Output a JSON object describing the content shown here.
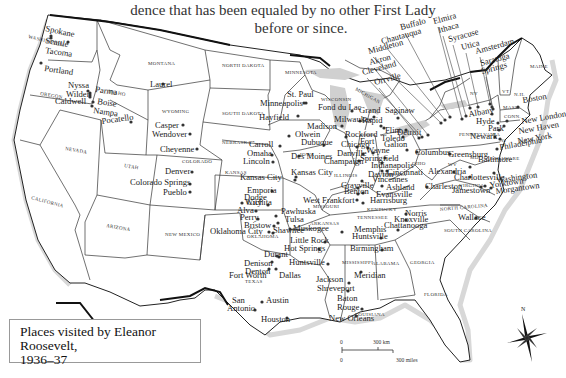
{
  "caption": {
    "line1": "dence that has been equaled by no other First Lady",
    "line2": "before or since."
  },
  "legend": {
    "title_line1": "Places visited by Eleanor Roosevelt,",
    "title_line2": "1936–37"
  },
  "scale_bar": {
    "km_zero": "0",
    "km_label": "300 km",
    "mi_zero": "0",
    "mi_label": "300 miles"
  },
  "compass": {
    "north_label": "N"
  },
  "states": [
    {
      "name": "WASHINGTON",
      "x": 28,
      "y": 38,
      "r": 14
    },
    {
      "name": "OREGON",
      "x": 40,
      "y": 95,
      "r": 10
    },
    {
      "name": "IDAHO",
      "x": 108,
      "y": 93,
      "r": 10
    },
    {
      "name": "MONTANA",
      "x": 148,
      "y": 65,
      "r": 0
    },
    {
      "name": "NORTH DAKOTA",
      "x": 222,
      "y": 67,
      "r": 0
    },
    {
      "name": "MINNESOTA",
      "x": 285,
      "y": 74,
      "r": 0
    },
    {
      "name": "SOUTH DAKOTA",
      "x": 222,
      "y": 115,
      "r": 0
    },
    {
      "name": "WYOMING",
      "x": 162,
      "y": 113,
      "r": 0
    },
    {
      "name": "NEBRASKA",
      "x": 222,
      "y": 144,
      "r": 0
    },
    {
      "name": "IOWA",
      "x": 300,
      "y": 156,
      "r": 0
    },
    {
      "name": "ILLINOIS",
      "x": 334,
      "y": 177,
      "r": 0
    },
    {
      "name": "WISCONSIN",
      "x": 321,
      "y": 101,
      "r": 0
    },
    {
      "name": "MICHIGAN",
      "x": 355,
      "y": 90,
      "r": 30
    },
    {
      "name": "NEVADA",
      "x": 65,
      "y": 150,
      "r": 10
    },
    {
      "name": "UTAH",
      "x": 124,
      "y": 167,
      "r": 10
    },
    {
      "name": "COLORADO",
      "x": 182,
      "y": 163,
      "r": 0
    },
    {
      "name": "KANSAS",
      "x": 225,
      "y": 174,
      "r": 0
    },
    {
      "name": "CALIFORNIA",
      "x": 31,
      "y": 199,
      "r": 15
    },
    {
      "name": "ARIZONA",
      "x": 106,
      "y": 227,
      "r": 10
    },
    {
      "name": "NEW MEXICO",
      "x": 165,
      "y": 236,
      "r": 0
    },
    {
      "name": "OKLAHOMA",
      "x": 247,
      "y": 238,
      "r": 0
    },
    {
      "name": "TEXAS",
      "x": 245,
      "y": 283,
      "r": 0
    },
    {
      "name": "ARKANSAS",
      "x": 310,
      "y": 225,
      "r": 0
    },
    {
      "name": "MISSOURI",
      "x": 313,
      "y": 208,
      "r": 0
    },
    {
      "name": "TENNESSEE",
      "x": 357,
      "y": 219,
      "r": 0
    },
    {
      "name": "KENTUCKY",
      "x": 367,
      "y": 211,
      "r": 0
    },
    {
      "name": "MISSISSIPPI",
      "x": 342,
      "y": 264,
      "r": 0
    },
    {
      "name": "ALABAMA",
      "x": 372,
      "y": 265,
      "r": 0
    },
    {
      "name": "GEORGIA",
      "x": 410,
      "y": 264,
      "r": 0
    },
    {
      "name": "FLORIDA",
      "x": 424,
      "y": 296,
      "r": 0
    },
    {
      "name": "LOUISIANA",
      "x": 355,
      "y": 316,
      "r": 0
    },
    {
      "name": "NORTH CAROLINA",
      "x": 440,
      "y": 211,
      "r": -5
    },
    {
      "name": "SOUTH CAROLINA",
      "x": 444,
      "y": 232,
      "r": 0
    },
    {
      "name": "VIRGINIA",
      "x": 459,
      "y": 187,
      "r": 0
    },
    {
      "name": "INDIANA",
      "x": 383,
      "y": 176,
      "r": 0
    },
    {
      "name": "OHIO",
      "x": 412,
      "y": 165,
      "r": 0
    },
    {
      "name": "PENNSYLVANIA",
      "x": 459,
      "y": 136,
      "r": 0
    },
    {
      "name": "NY",
      "x": 470,
      "y": 95,
      "r": 0
    },
    {
      "name": "NJ",
      "x": 500,
      "y": 142,
      "r": 0
    },
    {
      "name": "MD",
      "x": 470,
      "y": 159,
      "r": 0
    },
    {
      "name": "DELAWARE",
      "x": 490,
      "y": 160,
      "r": 0
    },
    {
      "name": "VT",
      "x": 502,
      "y": 93,
      "r": 0
    },
    {
      "name": "N.H.",
      "x": 514,
      "y": 96,
      "r": 0
    },
    {
      "name": "MAINE",
      "x": 530,
      "y": 68,
      "r": 0
    },
    {
      "name": "MASS.",
      "x": 503,
      "y": 109,
      "r": 0
    },
    {
      "name": "CONN.",
      "x": 504,
      "y": 118,
      "r": 0
    },
    {
      "name": "WV",
      "x": 448,
      "y": 166,
      "r": 0
    }
  ],
  "cities": [
    {
      "name": "Spokane",
      "x": 45,
      "y": 31,
      "dx": 68,
      "dy": 42,
      "r": 12
    },
    {
      "name": "Seattle",
      "x": 45,
      "y": 43,
      "dx": 51,
      "dy": 36,
      "r": 10
    },
    {
      "name": "Tacoma",
      "x": 45,
      "y": 53,
      "dx": 51,
      "dy": 38,
      "r": 8
    },
    {
      "name": "Portland",
      "x": 44,
      "y": 71,
      "dx": 41,
      "dy": 63,
      "r": 8
    },
    {
      "name": "Nyssa",
      "x": 68,
      "y": 88,
      "dx": 88,
      "dy": 91,
      "r": 0
    },
    {
      "name": "Parma",
      "x": 95,
      "y": 92,
      "dx": 90,
      "dy": 93,
      "r": 8
    },
    {
      "name": "Wilder",
      "x": 66,
      "y": 97,
      "dx": 90,
      "dy": 95,
      "r": 0
    },
    {
      "name": "Caldwell",
      "x": 55,
      "y": 104,
      "dx": 90,
      "dy": 97,
      "r": 0
    },
    {
      "name": "Boise",
      "x": 97,
      "y": 104,
      "dx": 93,
      "dy": 102,
      "r": 8
    },
    {
      "name": "Nampa",
      "x": 93,
      "y": 113,
      "dx": 92,
      "dy": 106,
      "r": 8
    },
    {
      "name": "Pocatello",
      "x": 102,
      "y": 124,
      "dx": 131,
      "dy": 122,
      "r": -8
    },
    {
      "name": "Laurel",
      "x": 150,
      "y": 87,
      "dx": 163,
      "dy": 84,
      "r": 0
    },
    {
      "name": "Casper",
      "x": 155,
      "y": 128,
      "dx": 183,
      "dy": 125,
      "r": 0
    },
    {
      "name": "Wendover",
      "x": 152,
      "y": 137,
      "dx": 190,
      "dy": 134,
      "r": 0
    },
    {
      "name": "Cheyenne",
      "x": 160,
      "y": 152,
      "dx": 197,
      "dy": 149,
      "r": 0
    },
    {
      "name": "Denver",
      "x": 165,
      "y": 174,
      "dx": 192,
      "dy": 172,
      "r": 0
    },
    {
      "name": "Colorado Springs",
      "x": 130,
      "y": 185,
      "dx": 190,
      "dy": 184,
      "r": 0
    },
    {
      "name": "Pueblo",
      "x": 163,
      "y": 195,
      "dx": 190,
      "dy": 192,
      "r": 0
    },
    {
      "name": "St. Paul",
      "x": 287,
      "y": 97,
      "dx": 306,
      "dy": 103,
      "r": 0
    },
    {
      "name": "Minneapolis",
      "x": 260,
      "y": 106,
      "dx": 304,
      "dy": 103,
      "r": 0
    },
    {
      "name": "Hayfield",
      "x": 259,
      "y": 120,
      "dx": 298,
      "dy": 116,
      "r": 0
    },
    {
      "name": "Fond du Lac",
      "x": 318,
      "y": 110,
      "dx": 352,
      "dy": 111,
      "r": 0
    },
    {
      "name": "Madison",
      "x": 307,
      "y": 129,
      "dx": 342,
      "dy": 126,
      "r": 0
    },
    {
      "name": "Milwaukee",
      "x": 334,
      "y": 122,
      "dx": 360,
      "dy": 121,
      "r": 0
    },
    {
      "name": "Grand",
      "x": 359,
      "y": 113,
      "dx": 374,
      "dy": 117,
      "r": 0
    },
    {
      "name": "Rapid",
      "x": 362,
      "y": 123,
      "dx": 381,
      "dy": 126,
      "r": 0
    },
    {
      "name": "Saginaw",
      "x": 385,
      "y": 113,
      "dx": 398,
      "dy": 118,
      "r": 0
    },
    {
      "name": "Flint",
      "x": 385,
      "y": 133,
      "dx": 384,
      "dy": 128,
      "r": 0
    },
    {
      "name": "Detroit",
      "x": 397,
      "y": 135,
      "dx": 406,
      "dy": 130,
      "r": 0
    },
    {
      "name": "Toledo",
      "x": 381,
      "y": 141,
      "dx": 403,
      "dy": 137,
      "r": 0
    },
    {
      "name": "Carroll",
      "x": 249,
      "y": 147,
      "dx": 280,
      "dy": 146,
      "r": 0
    },
    {
      "name": "Omaha",
      "x": 247,
      "y": 156,
      "dx": 272,
      "dy": 155,
      "r": 0
    },
    {
      "name": "Lincoln",
      "x": 243,
      "y": 164,
      "dx": 273,
      "dy": 162,
      "r": 0
    },
    {
      "name": "Olwein",
      "x": 295,
      "y": 137,
      "dx": 289,
      "dy": 136,
      "r": 0
    },
    {
      "name": "Dubuque",
      "x": 301,
      "y": 145,
      "dx": 324,
      "dy": 145,
      "r": 0
    },
    {
      "name": "Des Moines",
      "x": 291,
      "y": 159,
      "dx": 299,
      "dy": 156,
      "r": 0
    },
    {
      "name": "Rockford",
      "x": 345,
      "y": 137,
      "dx": 346,
      "dy": 137,
      "r": 0
    },
    {
      "name": "Chicago",
      "x": 341,
      "y": 147,
      "dx": 357,
      "dy": 147,
      "r": 0
    },
    {
      "name": "Fort",
      "x": 360,
      "y": 144,
      "dx": 368,
      "dy": 148,
      "r": 0
    },
    {
      "name": "Wayne",
      "x": 366,
      "y": 153,
      "dx": 373,
      "dy": 153,
      "r": 0
    },
    {
      "name": "Galion",
      "x": 384,
      "y": 147,
      "dx": 407,
      "dy": 150,
      "r": 0
    },
    {
      "name": "Springfield",
      "x": 360,
      "y": 161,
      "dx": 385,
      "dy": 158,
      "r": 0
    },
    {
      "name": "Danville",
      "x": 337,
      "y": 156,
      "dx": 363,
      "dy": 154,
      "r": 0
    },
    {
      "name": "Champaign",
      "x": 324,
      "y": 164,
      "dx": 359,
      "dy": 161,
      "r": 0
    },
    {
      "name": "Indianapolis",
      "x": 371,
      "y": 168,
      "dx": 382,
      "dy": 163,
      "r": 0
    },
    {
      "name": "Columbus",
      "x": 415,
      "y": 155,
      "dx": 417,
      "dy": 152,
      "r": 0
    },
    {
      "name": "Dayton",
      "x": 368,
      "y": 177,
      "dx": 382,
      "dy": 171,
      "r": 0
    },
    {
      "name": "Cincinnati",
      "x": 387,
      "y": 175,
      "dx": 387,
      "dy": 171,
      "r": 0
    },
    {
      "name": "Vincennes",
      "x": 372,
      "y": 182,
      "dx": 362,
      "dy": 181,
      "r": 0
    },
    {
      "name": "Ashland",
      "x": 386,
      "y": 190,
      "dx": 382,
      "dy": 186,
      "r": 0
    },
    {
      "name": "Evansville",
      "x": 376,
      "y": 197,
      "dx": 363,
      "dy": 193,
      "r": 0
    },
    {
      "name": "Grayville",
      "x": 341,
      "y": 188,
      "dx": 358,
      "dy": 188,
      "r": 0
    },
    {
      "name": "Benton",
      "x": 344,
      "y": 194,
      "dx": 358,
      "dy": 194,
      "r": 0
    },
    {
      "name": "West Frankfort",
      "x": 303,
      "y": 203,
      "dx": 357,
      "dy": 200,
      "r": 0
    },
    {
      "name": "Harrisburg",
      "x": 370,
      "y": 203,
      "dx": 363,
      "dy": 203,
      "r": 0
    },
    {
      "name": "Kansas City",
      "x": 291,
      "y": 175,
      "dx": 296,
      "dy": 177,
      "r": 0
    },
    {
      "name": "Kansas City",
      "x": 240,
      "y": 180,
      "dx": 295,
      "dy": 180,
      "r": 0
    },
    {
      "name": "Emporia",
      "x": 247,
      "y": 193,
      "dx": 272,
      "dy": 191,
      "r": 0
    },
    {
      "name": "Dodge",
      "x": 244,
      "y": 200,
      "dx": 0,
      "dy": 0,
      "r": 0
    },
    {
      "name": "City",
      "x": 247,
      "y": 205,
      "dx": 242,
      "dy": 203,
      "r": 0
    },
    {
      "name": "Wichita",
      "x": 245,
      "y": 205,
      "dx": 268,
      "dy": 205,
      "r": 0
    },
    {
      "name": "Alva",
      "x": 237,
      "y": 213,
      "dx": 256,
      "dy": 211,
      "r": 0
    },
    {
      "name": "Pawhuska",
      "x": 281,
      "y": 214,
      "dx": 276,
      "dy": 216,
      "r": 0
    },
    {
      "name": "Perry",
      "x": 240,
      "y": 220,
      "dx": 258,
      "dy": 219,
      "r": 0
    },
    {
      "name": "Tulsa",
      "x": 285,
      "y": 222,
      "dx": 278,
      "dy": 223,
      "r": 0
    },
    {
      "name": "Bristow",
      "x": 244,
      "y": 228,
      "dx": 274,
      "dy": 226,
      "r": 0
    },
    {
      "name": "Muskogee",
      "x": 293,
      "y": 231,
      "dx": 290,
      "dy": 229,
      "r": 0
    },
    {
      "name": "Oklahoma City",
      "x": 210,
      "y": 234,
      "dx": 269,
      "dy": 232,
      "r": 0
    },
    {
      "name": "Shawnee",
      "x": 273,
      "y": 233,
      "dx": 273,
      "dy": 233,
      "r": 0
    },
    {
      "name": "Little Rock",
      "x": 290,
      "y": 243,
      "dx": 325,
      "dy": 242,
      "r": 0
    },
    {
      "name": "Hot Springs",
      "x": 284,
      "y": 251,
      "dx": 319,
      "dy": 249,
      "r": 0
    },
    {
      "name": "Durant",
      "x": 264,
      "y": 257,
      "dx": 279,
      "dy": 257,
      "r": 0
    },
    {
      "name": "Denison",
      "x": 244,
      "y": 266,
      "dx": 277,
      "dy": 256,
      "r": 0
    },
    {
      "name": "Denton",
      "x": 245,
      "y": 274,
      "dx": 272,
      "dy": 262,
      "r": 0
    },
    {
      "name": "Fort Worth",
      "x": 229,
      "y": 278,
      "dx": 269,
      "dy": 269,
      "r": 0
    },
    {
      "name": "Dallas",
      "x": 279,
      "y": 278,
      "dx": 276,
      "dy": 269,
      "r": 0
    },
    {
      "name": "Huntsville",
      "x": 289,
      "y": 265,
      "dx": 328,
      "dy": 264,
      "r": 0
    },
    {
      "name": "Jackson",
      "x": 316,
      "y": 282,
      "dx": 349,
      "dy": 283,
      "r": 0
    },
    {
      "name": "Shreveport",
      "x": 317,
      "y": 291,
      "dx": 348,
      "dy": 291,
      "r": 0
    },
    {
      "name": "San",
      "x": 232,
      "y": 303,
      "dx": 0,
      "dy": 0,
      "r": 0
    },
    {
      "name": "Antonio",
      "x": 227,
      "y": 311,
      "dx": 255,
      "dy": 310,
      "r": 0
    },
    {
      "name": "Austin",
      "x": 266,
      "y": 303,
      "dx": 262,
      "dy": 302,
      "r": 0
    },
    {
      "name": "Houston",
      "x": 261,
      "y": 322,
      "dx": 287,
      "dy": 318,
      "r": 0
    },
    {
      "name": "Baton",
      "x": 337,
      "y": 301,
      "dx": 0,
      "dy": 0,
      "r": 0
    },
    {
      "name": "Rouge",
      "x": 337,
      "y": 310,
      "dx": 362,
      "dy": 309,
      "r": 0
    },
    {
      "name": "New Orleans",
      "x": 329,
      "y": 321,
      "dx": 356,
      "dy": 316,
      "r": 0
    },
    {
      "name": "Memphis",
      "x": 354,
      "y": 232,
      "dx": 342,
      "dy": 232,
      "r": 0
    },
    {
      "name": "Norris",
      "x": 405,
      "y": 216,
      "dx": 406,
      "dy": 214,
      "r": 0
    },
    {
      "name": "Knoxville",
      "x": 394,
      "y": 222,
      "dx": 406,
      "dy": 220,
      "r": 0
    },
    {
      "name": "Chattanooga",
      "x": 384,
      "y": 228,
      "dx": 398,
      "dy": 230,
      "r": 0
    },
    {
      "name": "Huntsville",
      "x": 352,
      "y": 239,
      "dx": 381,
      "dy": 238,
      "r": 0
    },
    {
      "name": "Birmingham",
      "x": 350,
      "y": 251,
      "dx": 382,
      "dy": 250,
      "r": 0
    },
    {
      "name": "Meridian",
      "x": 354,
      "y": 278,
      "dx": 361,
      "dy": 272,
      "r": 0
    },
    {
      "name": "Wallace",
      "x": 458,
      "y": 220,
      "dx": 476,
      "dy": 218,
      "r": 0
    },
    {
      "name": "Charleston",
      "x": 425,
      "y": 189,
      "dx": 427,
      "dy": 187,
      "r": 0
    },
    {
      "name": "Alexandria",
      "x": 428,
      "y": 174,
      "dx": 454,
      "dy": 172,
      "r": 0
    },
    {
      "name": "Greensburg",
      "x": 448,
      "y": 157,
      "dx": 450,
      "dy": 154,
      "r": 0
    },
    {
      "name": "Baltimore",
      "x": 478,
      "y": 162,
      "dx": 470,
      "dy": 167,
      "r": 0
    },
    {
      "name": "Charlottesville",
      "x": 454,
      "y": 180,
      "dx": 470,
      "dy": 177,
      "r": 0
    },
    {
      "name": "Washington",
      "x": 497,
      "y": 183,
      "dx": 494,
      "dy": 173,
      "r": -8
    },
    {
      "name": "Yorktown",
      "x": 490,
      "y": 188,
      "dx": 485,
      "dy": 186,
      "r": -8
    },
    {
      "name": "Morgantown",
      "x": 496,
      "y": 194,
      "dx": 491,
      "dy": 188,
      "r": -8
    },
    {
      "name": "Jamestown",
      "x": 452,
      "y": 193,
      "dx": 481,
      "dy": 187,
      "r": 0
    },
    {
      "name": "Philadelphia",
      "x": 500,
      "y": 150,
      "dx": 497,
      "dy": 149,
      "r": -10
    },
    {
      "name": "New York",
      "x": 518,
      "y": 144,
      "dx": 500,
      "dy": 139,
      "r": -10
    },
    {
      "name": "New Haven",
      "x": 519,
      "y": 134,
      "dx": 504,
      "dy": 126,
      "r": -10
    },
    {
      "name": "New London",
      "x": 522,
      "y": 124,
      "dx": 507,
      "dy": 121,
      "r": -10
    },
    {
      "name": "Newark",
      "x": 470,
      "y": 139,
      "dx": 495,
      "dy": 137,
      "r": 0
    },
    {
      "name": "Hyde",
      "x": 476,
      "y": 124,
      "dx": 498,
      "dy": 123,
      "r": 0
    },
    {
      "name": "Park",
      "x": 488,
      "y": 131,
      "dx": 499,
      "dy": 130,
      "r": 0
    },
    {
      "name": "Albany",
      "x": 469,
      "y": 117,
      "dx": 492,
      "dy": 114,
      "r": -10
    },
    {
      "name": "Boston",
      "x": 523,
      "y": 103,
      "dx": 518,
      "dy": 107,
      "r": -10
    }
  ],
  "callout_cities": [
    {
      "name": "Buffalo",
      "lx": 401,
      "ly": 30,
      "px": 450,
      "py": 117,
      "r": -15
    },
    {
      "name": "Elmira",
      "lx": 434,
      "ly": 24,
      "px": 462,
      "py": 119,
      "r": -15
    },
    {
      "name": "Ithaca",
      "lx": 439,
      "ly": 33,
      "px": 466,
      "py": 116,
      "r": -15
    },
    {
      "name": "Chautauqua",
      "lx": 382,
      "ly": 44,
      "px": 445,
      "py": 120,
      "r": -15
    },
    {
      "name": "Syracuse",
      "lx": 449,
      "ly": 42,
      "px": 470,
      "py": 108,
      "r": -15
    },
    {
      "name": "Middleton",
      "lx": 369,
      "ly": 54,
      "px": 441,
      "py": 123,
      "r": -15
    },
    {
      "name": "Utica",
      "lx": 462,
      "ly": 50,
      "px": 478,
      "py": 107,
      "r": -15
    },
    {
      "name": "Akron",
      "lx": 370,
      "ly": 65,
      "px": 428,
      "py": 135,
      "r": -15
    },
    {
      "name": "Amsterdam",
      "lx": 476,
      "ly": 54,
      "px": 490,
      "py": 104,
      "r": -15
    },
    {
      "name": "Cleveland",
      "lx": 363,
      "ly": 75,
      "px": 422,
      "py": 137,
      "r": -15
    },
    {
      "name": "Saratoga",
      "lx": 481,
      "ly": 66,
      "px": 492,
      "py": 107,
      "r": -15
    },
    {
      "name": "Springs",
      "lx": 482,
      "ly": 74,
      "px": 493,
      "py": 109,
      "r": -15
    },
    {
      "name": "Orrville",
      "lx": 375,
      "ly": 85,
      "px": 419,
      "py": 138,
      "r": -15
    }
  ]
}
